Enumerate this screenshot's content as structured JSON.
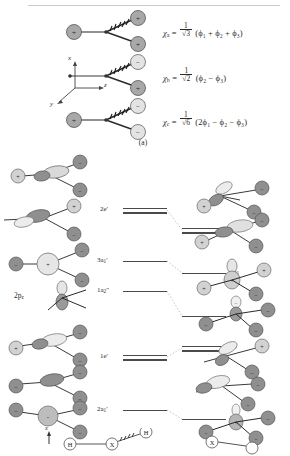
{
  "figure": {
    "panel_a": {
      "caption": "(a)",
      "axes": {
        "x": "x",
        "y": "y",
        "z": "z"
      },
      "combinations": [
        {
          "name": "chi_a",
          "symbol": "χ",
          "subscript": "a",
          "coefficient_numerator": "1",
          "coefficient_denominator": "√3",
          "expression": "(ϕ₁ + ϕ₂ + ϕ₃)",
          "full": "χa = (1/√3)(ϕ1 + ϕ2 + ϕ3)",
          "lobe_signs": [
            "+",
            "+",
            "+"
          ]
        },
        {
          "name": "chi_b",
          "symbol": "χ",
          "subscript": "b",
          "coefficient_numerator": "1",
          "coefficient_denominator": "√2",
          "expression": "(ϕ₂ − ϕ₃)",
          "full": "χb = (1/√2)(ϕ2 − ϕ3)",
          "lobe_signs": [
            "",
            "−",
            "+"
          ]
        },
        {
          "name": "chi_c",
          "symbol": "χ",
          "subscript": "c",
          "coefficient_numerator": "1",
          "coefficient_denominator": "√6",
          "expression": "(2ϕ₁ − ϕ₂ − ϕ₃)",
          "full": "χc = (1/√6)(2ϕ1 − ϕ2 − ϕ3)",
          "lobe_signs": [
            "+",
            "−",
            "−"
          ]
        }
      ]
    },
    "mo_diagram": {
      "left_geometry_label": "planar D3h",
      "right_geometry_label": "pyramidal C3v",
      "left_levels": [
        {
          "label_main": "2e",
          "label_prime": "′",
          "label_sub": "",
          "degenerate": true,
          "y": 62,
          "x": 123,
          "w": 44
        },
        {
          "label_main": "3a",
          "label_prime": "′",
          "label_sub": "1",
          "degenerate": false,
          "y": 113,
          "x": 123,
          "w": 44
        },
        {
          "label_main": "1a",
          "label_prime": "″",
          "label_sub": "2",
          "degenerate": false,
          "y": 143,
          "x": 123,
          "w": 44
        },
        {
          "label_main": "1e",
          "label_prime": "′",
          "label_sub": "",
          "degenerate": true,
          "y": 209,
          "x": 123,
          "w": 44
        },
        {
          "label_main": "2a",
          "label_prime": "′",
          "label_sub": "1",
          "degenerate": false,
          "y": 262,
          "x": 123,
          "w": 44
        }
      ],
      "right_levels": [
        {
          "label_main": "2e",
          "label_prime": "",
          "label_sub": "",
          "degenerate": true,
          "y": 82,
          "x": 182,
          "w": 44
        },
        {
          "label_main": "4a",
          "label_prime": "",
          "label_sub": "1",
          "degenerate": false,
          "y": 125,
          "x": 182,
          "w": 44
        },
        {
          "label_main": "3a",
          "label_prime": "",
          "label_sub": "1",
          "degenerate": false,
          "y": 168,
          "x": 182,
          "w": 44
        },
        {
          "label_main": "1e",
          "label_prime": "",
          "label_sub": "",
          "degenerate": true,
          "y": 200,
          "x": 182,
          "w": 44
        },
        {
          "label_main": "2a",
          "label_prime": "",
          "label_sub": "1",
          "degenerate": false,
          "y": 271,
          "x": 182,
          "w": 44
        }
      ],
      "orbital_side_label": "2p",
      "orbital_side_label_sub": "z"
    },
    "legend": {
      "axis_label": "x",
      "planar_atoms": [
        "H",
        "X",
        "H"
      ],
      "pyramidal_atoms": [
        "X"
      ]
    }
  }
}
